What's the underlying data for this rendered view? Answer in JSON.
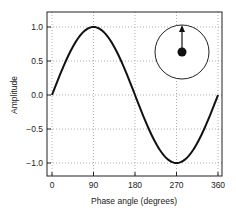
{
  "chart_data": {
    "type": "line",
    "title": "",
    "xlabel": "Phase angle (degrees)",
    "ylabel": "Amplitude",
    "xlim": [
      -10,
      370
    ],
    "ylim": [
      -1.2,
      1.2
    ],
    "xticks": [
      0,
      90,
      180,
      270,
      360
    ],
    "xtick_labels": [
      "0",
      "90",
      "180",
      "270",
      "360"
    ],
    "yticks": [
      1.0,
      0.5,
      0.0,
      -0.5,
      -1.0
    ],
    "ytick_labels": [
      "1.0",
      "0.5",
      "0.0",
      "−0.5",
      "−1.0"
    ],
    "grid": true,
    "legend": null,
    "series": [
      {
        "name": "sin(phase)",
        "x": [
          0,
          30,
          60,
          90,
          120,
          150,
          180,
          210,
          240,
          270,
          300,
          330,
          360
        ],
        "values": [
          0.0,
          0.5,
          0.866,
          1.0,
          0.866,
          0.5,
          0.0,
          -0.5,
          -0.866,
          -1.0,
          -0.866,
          -0.5,
          0.0
        ]
      }
    ],
    "inset": {
      "description": "phasor diagram: circle with center dot and arrow pointing up",
      "arrow_direction": "up"
    }
  },
  "colors": {
    "line": "#111111",
    "grid": "#9a9a9a",
    "frame": "#222222"
  }
}
